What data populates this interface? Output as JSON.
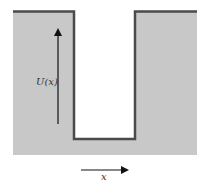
{
  "diagram": {
    "type": "potential-well",
    "labels": {
      "potential": "U(x)",
      "position": "x"
    },
    "colors": {
      "region_fill": "#c8c8c8",
      "well_fill": "#ffffff",
      "boundary_line": "#4a4a4a",
      "arrow": "#111111"
    }
  }
}
